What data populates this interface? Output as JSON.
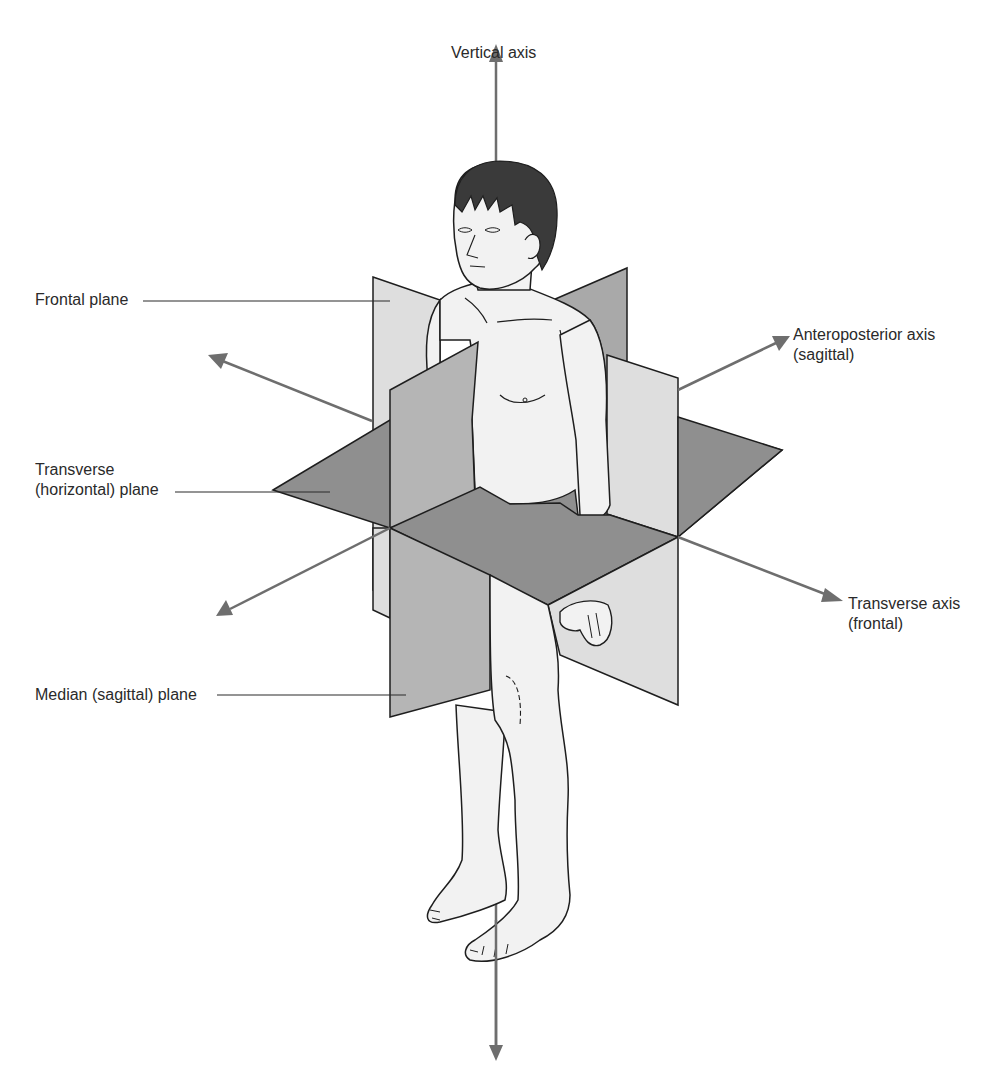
{
  "diagram": {
    "colors": {
      "background": "#ffffff",
      "transverse_plane": "#8f8f8f",
      "median_plane": "#b5b5b5",
      "frontal_plane": "#dedede",
      "back_plane_dark": "#a9a9a9",
      "axis_arrow": "#6e6e6e",
      "skin": "#f2f2f2",
      "hair": "#3a3a3a",
      "outline": "#1e1e1e",
      "leader_line": "#2a2a2a",
      "text": "#2a2a2a"
    },
    "labels": {
      "vertical_axis": "Vertical axis",
      "frontal_plane": "Frontal plane",
      "transverse_plane_line1": "Transverse",
      "transverse_plane_line2": "(horizontal) plane",
      "median_plane": "Median (sagittal) plane",
      "anteroposterior_axis_line1": "Anteroposterior axis",
      "anteroposterior_axis_line2": "(sagittal)",
      "transverse_axis_line1": "Transverse axis",
      "transverse_axis_line2": "(frontal)"
    },
    "planes": [
      {
        "name": "Frontal plane",
        "shade": "light"
      },
      {
        "name": "Transverse (horizontal) plane",
        "shade": "dark"
      },
      {
        "name": "Median (sagittal) plane",
        "shade": "medium"
      }
    ],
    "axes": [
      {
        "name": "Vertical axis",
        "direction": "up-down"
      },
      {
        "name": "Anteroposterior axis (sagittal)",
        "direction": "front-back"
      },
      {
        "name": "Transverse axis (frontal)",
        "direction": "left-right"
      }
    ]
  }
}
